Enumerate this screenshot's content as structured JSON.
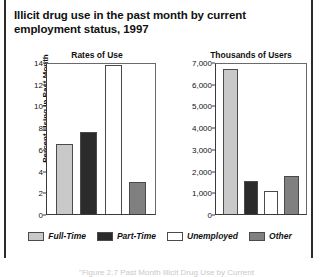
{
  "figure": {
    "title": "Illicit drug use in the past month by current employment status, 1997",
    "caption": "\"Figure 2.7 Past Month Illicit Drug Use by Current"
  },
  "legend": {
    "items": [
      {
        "label": "Full-Time",
        "color": "#c9c9c9"
      },
      {
        "label": "Part-Time",
        "color": "#2b2b2b"
      },
      {
        "label": "Unemployed",
        "color": "#ffffff"
      },
      {
        "label": "Other",
        "color": "#808080"
      }
    ]
  },
  "chart_data": [
    {
      "type": "bar",
      "title": "Rates of Use",
      "xlabel": "",
      "ylabel": "Percent Using in Past Month",
      "categories": [
        "Full-Time",
        "Part-Time",
        "Unemployed",
        "Other"
      ],
      "values": [
        6.5,
        7.7,
        13.9,
        3.0
      ],
      "ylim": [
        0,
        14
      ],
      "yticks": [
        "0",
        "2",
        "4",
        "6",
        "8",
        "10",
        "12",
        "14"
      ],
      "ytick_values": [
        0,
        2,
        4,
        6,
        8,
        10,
        12,
        14
      ],
      "grid": false,
      "legend_position": "bottom"
    },
    {
      "type": "bar",
      "title": "Thousands of Users",
      "xlabel": "",
      "ylabel": "",
      "categories": [
        "Full-Time",
        "Part-Time",
        "Unemployed",
        "Other"
      ],
      "values": [
        6750,
        1550,
        1080,
        1780
      ],
      "ylim": [
        0,
        7000
      ],
      "yticks": [
        "0",
        "1,000",
        "2,000",
        "3,000",
        "4,000",
        "5,000",
        "6,000",
        "7,000"
      ],
      "ytick_values": [
        0,
        1000,
        2000,
        3000,
        4000,
        5000,
        6000,
        7000
      ],
      "grid": false,
      "legend_position": "bottom"
    }
  ]
}
